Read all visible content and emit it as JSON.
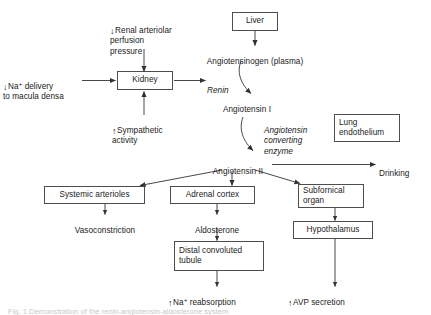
{
  "diagram": {
    "colors": {
      "ink": "#1a1a1a",
      "box_border": "#4d4d4d",
      "edge": "#333333",
      "background": "#ffffff"
    },
    "nodes": {
      "renal_perfusion": {
        "arrow": "↓",
        "text": "Renal arteriolar\nperfusion\npressure"
      },
      "na_delivery": {
        "arrow": "↓",
        "text_before_sup": "Na",
        "sup": "+",
        "text_after_sup": " delivery\nto macula densa"
      },
      "kidney": {
        "label": "Kidney"
      },
      "sympathetic": {
        "arrow": "↑",
        "text": "Sympathetic\nactivity"
      },
      "liver": {
        "label": "Liver"
      },
      "angiotensinogen": {
        "label": "Angiotensinogen (plasma)"
      },
      "renin": {
        "label": "Renin"
      },
      "angiotensin_i": {
        "label": "Angiotensin I"
      },
      "ace": {
        "label": "Angiotensin\nconverting\nenzyme"
      },
      "lung_endothelium": {
        "label": "Lung\nendothelium"
      },
      "angiotensin_ii": {
        "label": "Angiotensin II"
      },
      "drinking": {
        "label": "Drinking"
      },
      "systemic_arterioles": {
        "label": "Systemic arterioles"
      },
      "vasoconstriction": {
        "label": "Vasoconstriction"
      },
      "adrenal_cortex": {
        "label": "Adrenal cortex"
      },
      "aldosterone": {
        "label": "Aldosterone"
      },
      "distal_tubule": {
        "label": "Distal convoluted\ntubule"
      },
      "na_reabsorption": {
        "arrow": "↑",
        "text_before_sup": "Na",
        "sup": "+",
        "text_after_sup": " reabsorption"
      },
      "subfornical_organ": {
        "label": "Subfornical\norgan"
      },
      "hypothalamus": {
        "label": "Hypothalamus"
      },
      "avp_secretion": {
        "arrow": "↑",
        "text": "AVP secretion"
      }
    },
    "caption": {
      "text": "Fig. 1   Demonstration of the renin-angiotensin-aldosterone system"
    }
  }
}
